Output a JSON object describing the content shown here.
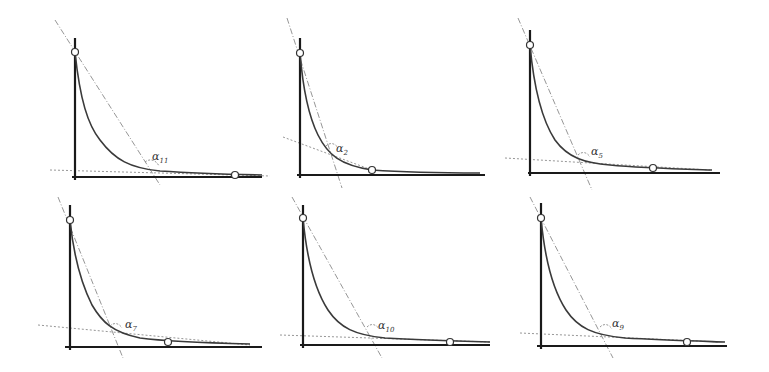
{
  "figure": {
    "line_color": "#3a3a3a",
    "tangent_color": "#8a8a8a",
    "background": "#ffffff"
  },
  "panels": [
    {
      "id": "p1",
      "label": "α",
      "subscript": "11",
      "y_axis": {
        "x": 75,
        "y1": 38,
        "y2": 180
      },
      "x_axis": {
        "y": 177,
        "x1": 72,
        "x2": 262
      },
      "start_point": {
        "x": 75,
        "y": 52
      },
      "end_point": {
        "x": 235,
        "y": 175
      },
      "curve": "M75,52 C80,100 88,125 100,140 C115,160 130,168 160,171 C190,173 215,174 262,175",
      "steep_line": {
        "x1": 55,
        "y1": 20,
        "x2": 160,
        "y2": 185
      },
      "shallow_line": {
        "x1": 50,
        "y1": 170,
        "x2": 270,
        "y2": 176
      },
      "arc": "M145,162 C150,158 156,160 159,166",
      "label_pos": {
        "x": 152,
        "y": 160
      }
    },
    {
      "id": "p2",
      "label": "α",
      "subscript": "2",
      "y_axis": {
        "x": 300,
        "y1": 38,
        "y2": 178
      },
      "x_axis": {
        "y": 175,
        "x1": 297,
        "x2": 485
      },
      "start_point": {
        "x": 300,
        "y": 53
      },
      "end_point": {
        "x": 372,
        "y": 170
      },
      "curve": "M300,53 C303,90 308,115 318,135 C328,155 340,165 372,170 C400,172 440,173 480,173",
      "steep_line": {
        "x1": 287,
        "y1": 18,
        "x2": 342,
        "y2": 188
      },
      "shallow_line": {
        "x1": 283,
        "y1": 137,
        "x2": 372,
        "y2": 170
      },
      "arc": "M326,146 C330,142 335,143 338,148",
      "label_pos": {
        "x": 336,
        "y": 152
      }
    },
    {
      "id": "p3",
      "label": "α",
      "subscript": "5",
      "y_axis": {
        "x": 530,
        "y1": 30,
        "y2": 176
      },
      "x_axis": {
        "y": 173,
        "x1": 528,
        "x2": 720
      },
      "start_point": {
        "x": 530,
        "y": 45
      },
      "end_point": {
        "x": 653,
        "y": 168
      },
      "curve": "M530,45 C534,90 542,120 555,140 C568,158 585,163 610,165 C640,168 680,169 712,170",
      "steep_line": {
        "x1": 518,
        "y1": 18,
        "x2": 592,
        "y2": 190
      },
      "shallow_line": {
        "x1": 505,
        "y1": 158,
        "x2": 710,
        "y2": 170
      },
      "arc": "M578,155 C582,151 587,152 590,157",
      "label_pos": {
        "x": 591,
        "y": 155
      }
    },
    {
      "id": "p4",
      "label": "α",
      "subscript": "7",
      "y_axis": {
        "x": 70,
        "y1": 205,
        "y2": 350
      },
      "x_axis": {
        "y": 347,
        "x1": 65,
        "x2": 262
      },
      "start_point": {
        "x": 70,
        "y": 220
      },
      "end_point": {
        "x": 168,
        "y": 342
      },
      "curve": "M70,220 C74,260 82,285 92,305 C102,322 112,332 140,338 C170,342 210,343 250,344",
      "steep_line": {
        "x1": 58,
        "y1": 197,
        "x2": 123,
        "y2": 358
      },
      "shallow_line": {
        "x1": 38,
        "y1": 325,
        "x2": 250,
        "y2": 345
      },
      "arc": "M110,326 C114,322 119,323 122,328",
      "label_pos": {
        "x": 125,
        "y": 328
      }
    },
    {
      "id": "p5",
      "label": "α",
      "subscript": "10",
      "y_axis": {
        "x": 303,
        "y1": 205,
        "y2": 348
      },
      "x_axis": {
        "y": 345,
        "x1": 300,
        "x2": 490
      },
      "start_point": {
        "x": 303,
        "y": 218
      },
      "end_point": {
        "x": 450,
        "y": 342
      },
      "curve": "M303,218 C307,262 315,290 328,310 C340,328 355,335 385,338 C420,340 455,341 490,342",
      "steep_line": {
        "x1": 292,
        "y1": 197,
        "x2": 382,
        "y2": 358
      },
      "shallow_line": {
        "x1": 280,
        "y1": 335,
        "x2": 490,
        "y2": 342
      },
      "arc": "M367,327 C371,323 376,324 379,329",
      "label_pos": {
        "x": 378,
        "y": 329
      }
    },
    {
      "id": "p6",
      "label": "α",
      "subscript": "9",
      "y_axis": {
        "x": 541,
        "y1": 203,
        "y2": 349
      },
      "x_axis": {
        "y": 346,
        "x1": 537,
        "x2": 727
      },
      "start_point": {
        "x": 541,
        "y": 218
      },
      "end_point": {
        "x": 687,
        "y": 342
      },
      "curve": "M541,218 C545,262 553,290 566,310 C578,328 593,335 625,338 C660,340 695,341 725,342",
      "steep_line": {
        "x1": 530,
        "y1": 197,
        "x2": 613,
        "y2": 358
      },
      "shallow_line": {
        "x1": 520,
        "y1": 333,
        "x2": 720,
        "y2": 342
      },
      "arc": "M600,327 C604,323 609,324 612,329",
      "label_pos": {
        "x": 612,
        "y": 327
      }
    }
  ]
}
